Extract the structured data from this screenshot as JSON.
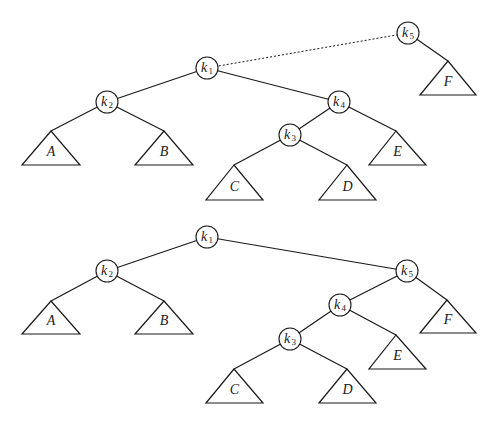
{
  "diagram": {
    "type": "binary-tree-rotation",
    "trees": [
      {
        "id": "top",
        "nodes": [
          {
            "id": "k1",
            "label": "k",
            "sub": "1",
            "x": 207,
            "y": 68
          },
          {
            "id": "k2",
            "label": "k",
            "sub": "2",
            "x": 107,
            "y": 102
          },
          {
            "id": "k4",
            "label": "k",
            "sub": "4",
            "x": 339,
            "y": 102
          },
          {
            "id": "k3",
            "label": "k",
            "sub": "3",
            "x": 290,
            "y": 135
          },
          {
            "id": "k5",
            "label": "k",
            "sub": "5",
            "x": 408,
            "y": 33
          }
        ],
        "subtrees": [
          {
            "id": "A",
            "label": "A",
            "apex": [
              51,
              131
            ],
            "base_y": 165,
            "left": 22,
            "right": 80
          },
          {
            "id": "B",
            "label": "B",
            "apex": [
              164,
              131
            ],
            "base_y": 165,
            "left": 135,
            "right": 193
          },
          {
            "id": "C",
            "label": "C",
            "apex": [
              234,
              165
            ],
            "base_y": 200,
            "left": 206,
            "right": 263
          },
          {
            "id": "D",
            "label": "D",
            "apex": [
              347,
              165
            ],
            "base_y": 200,
            "left": 319,
            "right": 376
          },
          {
            "id": "E",
            "label": "E",
            "apex": [
              396,
              131
            ],
            "base_y": 165,
            "left": 369,
            "right": 426
          },
          {
            "id": "F",
            "label": "F",
            "apex": [
              448,
              61
            ],
            "base_y": 95,
            "left": 420,
            "right": 476
          }
        ],
        "edges": [
          [
            "k1",
            "k2"
          ],
          [
            "k1",
            "k4"
          ],
          [
            "k2",
            "A"
          ],
          [
            "k2",
            "B"
          ],
          [
            "k4",
            "k3"
          ],
          [
            "k4",
            "E"
          ],
          [
            "k3",
            "C"
          ],
          [
            "k3",
            "D"
          ],
          [
            "k5",
            "F"
          ]
        ],
        "dashed_edges": [
          [
            "k1",
            "k5"
          ]
        ]
      },
      {
        "id": "bottom",
        "nodes": [
          {
            "id": "k1",
            "label": "k",
            "sub": "1",
            "x": 207,
            "y": 237
          },
          {
            "id": "k2",
            "label": "k",
            "sub": "2",
            "x": 107,
            "y": 271
          },
          {
            "id": "k5",
            "label": "k",
            "sub": "5",
            "x": 407,
            "y": 271
          },
          {
            "id": "k4",
            "label": "k",
            "sub": "4",
            "x": 340,
            "y": 305
          },
          {
            "id": "k3",
            "label": "k",
            "sub": "3",
            "x": 290,
            "y": 339
          }
        ],
        "subtrees": [
          {
            "id": "A",
            "label": "A",
            "apex": [
              51,
              301
            ],
            "base_y": 334,
            "left": 22,
            "right": 80
          },
          {
            "id": "B",
            "label": "B",
            "apex": [
              164,
              301
            ],
            "base_y": 334,
            "left": 135,
            "right": 193
          },
          {
            "id": "C",
            "label": "C",
            "apex": [
              234,
              369
            ],
            "base_y": 403,
            "left": 206,
            "right": 263
          },
          {
            "id": "D",
            "label": "D",
            "apex": [
              347,
              369
            ],
            "base_y": 403,
            "left": 319,
            "right": 376
          },
          {
            "id": "E",
            "label": "E",
            "apex": [
              396,
              335
            ],
            "base_y": 369,
            "left": 369,
            "right": 426
          },
          {
            "id": "F",
            "label": "F",
            "apex": [
              447,
              300
            ],
            "base_y": 333,
            "left": 420,
            "right": 476
          }
        ],
        "edges": [
          [
            "k1",
            "k2"
          ],
          [
            "k1",
            "k5"
          ],
          [
            "k2",
            "A"
          ],
          [
            "k2",
            "B"
          ],
          [
            "k5",
            "k4"
          ],
          [
            "k5",
            "F"
          ],
          [
            "k4",
            "k3"
          ],
          [
            "k4",
            "E"
          ],
          [
            "k3",
            "C"
          ],
          [
            "k3",
            "D"
          ]
        ],
        "dashed_edges": []
      }
    ],
    "node_radius": 11,
    "stroke_color": "#1a1a1a",
    "background": "#ffffff"
  }
}
